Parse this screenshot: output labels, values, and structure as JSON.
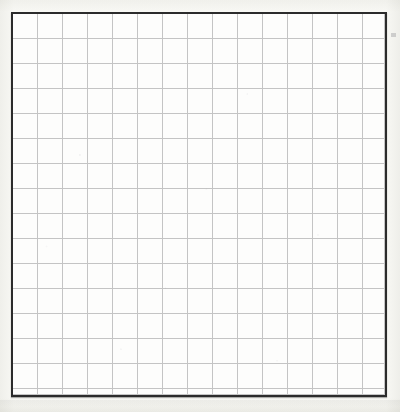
{
  "document": {
    "kind": "blank-grid-sheet",
    "title": "Blank Grid Sheet",
    "caption": "",
    "has_text": false,
    "has_labels": false,
    "has_data_marks": false
  },
  "page": {
    "width": 400,
    "height": 412,
    "background_color": "#f8f8f6",
    "paper_color": "#fdfdfc"
  },
  "grid": {
    "x": 11,
    "y": 12,
    "width": 376,
    "height": 385,
    "columns": 15,
    "rows": 15,
    "cell_size": 25,
    "line_color": "#c4c4c4",
    "line_width": 1,
    "border_color": "#2b2b2b",
    "border_width": 2,
    "cell_fill": "#fdfdfc"
  },
  "marks": {
    "edge_mark": {
      "x": 391,
      "y": 33,
      "color": "#78787d"
    }
  },
  "chart_data": {
    "type": "table",
    "title": "",
    "xlabel": "",
    "ylabel": "",
    "columns": 15,
    "rows": 15,
    "categories": [],
    "values": [],
    "grid": true,
    "legend": "none",
    "note": "Empty ruled grid: no plotted series, no tick labels, no annotations."
  }
}
